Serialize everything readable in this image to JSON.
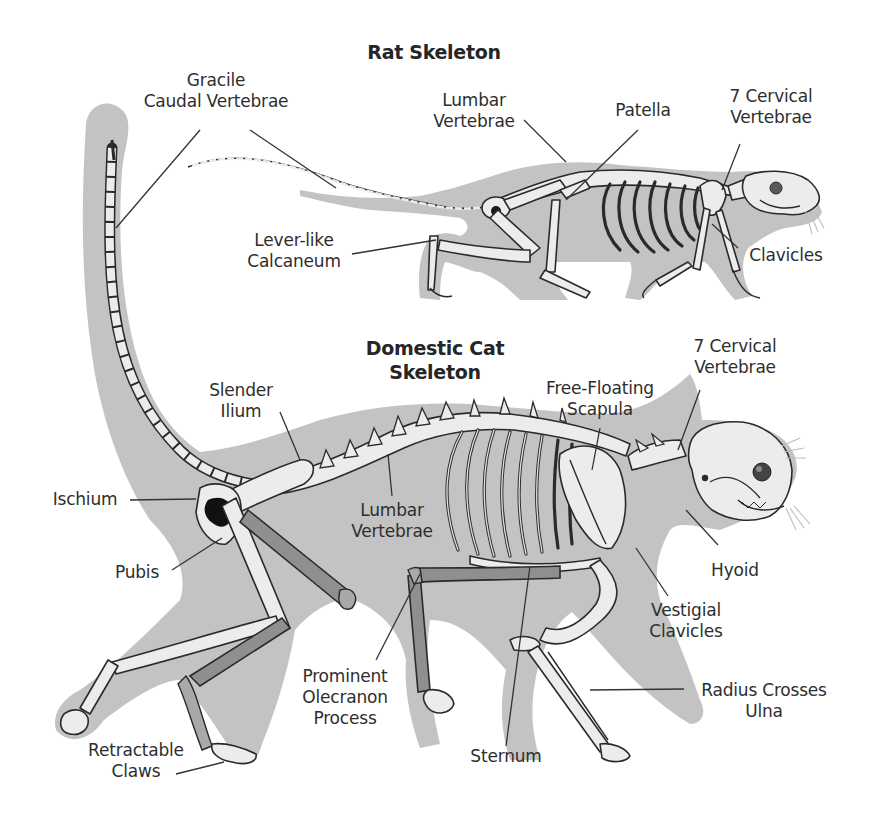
{
  "diagram": {
    "rat": {
      "title": [
        "Rat Skeleton"
      ],
      "labels": {
        "gracile_caudal": [
          "Gracile",
          "Caudal Vertebrae"
        ],
        "lumbar": [
          "Lumbar",
          "Vertebrae"
        ],
        "patella": [
          "Patella"
        ],
        "cervical": [
          "7 Cervical",
          "Vertebrae"
        ],
        "calcaneum": [
          "Lever-like",
          "Calcaneum"
        ],
        "clavicles": [
          "Clavicles"
        ]
      }
    },
    "cat": {
      "title": [
        "Domestic Cat",
        "Skeleton"
      ],
      "labels": {
        "cervical": [
          "7 Cervical",
          "Vertebrae"
        ],
        "slender_ilium": [
          "Slender",
          "Ilium"
        ],
        "scapula": [
          "Free-Floating",
          "Scapula"
        ],
        "ischium": [
          "Ischium"
        ],
        "lumbar": [
          "Lumbar",
          "Vertebrae"
        ],
        "hyoid": [
          "Hyoid"
        ],
        "pubis": [
          "Pubis"
        ],
        "vestigial_clavicles": [
          "Vestigial",
          "Clavicles"
        ],
        "olecranon": [
          "Prominent",
          "Olecranon",
          "Process"
        ],
        "radius_ulna": [
          "Radius Crosses",
          "Ulna"
        ],
        "sternum": [
          "Sternum"
        ],
        "claws": [
          "Retractable",
          "Claws"
        ]
      }
    },
    "colors": {
      "silhouette": "#c3c3c3",
      "bone": "#ececec",
      "bone_shaded": "#8f8f8f",
      "outline": "#2a2a2a",
      "text": "#2e2e2e"
    }
  }
}
